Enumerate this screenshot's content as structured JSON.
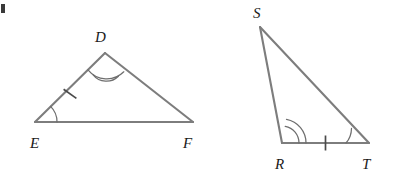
{
  "figure": {
    "background_color": "#ffffff",
    "stroke_color": "#7d7d7d",
    "mark_color": "#6e6e6e",
    "tick_color": "#4a4a4a",
    "label_color": "#1a1a1a",
    "width": 393,
    "height": 177
  },
  "triangles": [
    {
      "id": "triangle-def",
      "name": "Triangle DEF",
      "vertices": [
        {
          "label": "D",
          "x": 105,
          "y": 53,
          "label_x": 95,
          "label_y": 42
        },
        {
          "label": "E",
          "x": 35,
          "y": 122,
          "label_x": 30,
          "label_y": 148
        },
        {
          "label": "F",
          "x": 193,
          "y": 122,
          "label_x": 183,
          "label_y": 148
        }
      ],
      "edges": [
        {
          "from": "E",
          "to": "D"
        },
        {
          "from": "D",
          "to": "F"
        },
        {
          "from": "E",
          "to": "F"
        }
      ],
      "angle_marks": [
        {
          "at": "D",
          "arcs": 2,
          "radius": 17,
          "spacing": 5
        },
        {
          "at": "E",
          "arcs": 1,
          "radius": 22,
          "spacing": 5
        }
      ],
      "tick_marks": [
        {
          "on_edge": "ED",
          "count": 1
        }
      ]
    },
    {
      "id": "triangle-rst",
      "name": "Triangle RST",
      "vertices": [
        {
          "label": "S",
          "x": 260,
          "y": 27,
          "label_x": 253,
          "label_y": 18
        },
        {
          "label": "R",
          "x": 282,
          "y": 143,
          "label_x": 275,
          "label_y": 169
        },
        {
          "label": "T",
          "x": 369,
          "y": 143,
          "label_x": 362,
          "label_y": 169
        }
      ],
      "edges": [
        {
          "from": "S",
          "to": "R"
        },
        {
          "from": "S",
          "to": "T"
        },
        {
          "from": "R",
          "to": "T"
        }
      ],
      "angle_marks": [
        {
          "at": "R",
          "arcs": 2,
          "radius": 19,
          "spacing": 6
        },
        {
          "at": "T",
          "arcs": 1,
          "radius": 23,
          "spacing": 5
        }
      ],
      "tick_marks": [
        {
          "on_edge": "RT",
          "count": 1
        }
      ]
    }
  ],
  "artifact": {
    "name": "cropped-mark-top-left",
    "x": 1,
    "y": 4,
    "width": 4,
    "height": 9
  }
}
